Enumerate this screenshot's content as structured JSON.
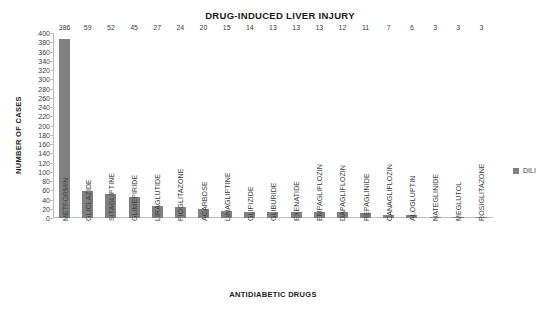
{
  "chart_data": {
    "type": "bar",
    "title": "DRUG-INDUCED LIVER INJURY",
    "xlabel": "ANTIDIABETIC DRUGS",
    "ylabel": "NUMBER OF CASES",
    "ylim": [
      0,
      400
    ],
    "ytick_step": 20,
    "yticks": [
      400,
      380,
      360,
      340,
      320,
      300,
      280,
      260,
      240,
      220,
      200,
      180,
      160,
      140,
      120,
      100,
      80,
      60,
      40,
      20,
      0
    ],
    "grid": false,
    "legend_position": "right",
    "bar_color": "#808080",
    "categories": [
      "METFORMIN",
      "GLICLAZIDE",
      "SITAGLIPTINE",
      "GLIMEPIRIDE",
      "LIRAGLUTIDE",
      "PIOGLITAZONE",
      "ACARBOSE",
      "LINAGLIPTINE",
      "GLIPIZIDE",
      "GLIBURIDE",
      "EXENATIDE",
      "EMPAGLIFLOZIN",
      "DAPAGLIFLOZIN",
      "REPAGLINIDE",
      "CANAGLIFLOZIN",
      "ALOGLUPTIN",
      "NATEGLINIDE",
      "MEGLUTOL",
      "ROSIGLITAZONE"
    ],
    "series": [
      {
        "name": "DILI",
        "values": [
          386,
          59,
          52,
          45,
          27,
          24,
          20,
          15,
          14,
          13,
          13,
          13,
          12,
          11,
          7,
          6,
          3,
          3,
          3
        ]
      }
    ]
  },
  "legend": {
    "entries": [
      {
        "label": "DILI",
        "color": "#808080"
      }
    ]
  }
}
